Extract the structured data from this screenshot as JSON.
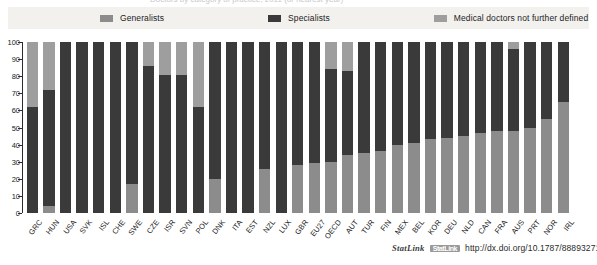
{
  "title_clipped": "Doctors by category of practice, 2011 (or nearest year)",
  "legend": {
    "position": "top",
    "items": [
      {
        "label": "Generalists",
        "color": "#8c8c8c",
        "key": "generalists"
      },
      {
        "label": "Specialists",
        "color": "#3a3a3a",
        "key": "specialists"
      },
      {
        "label": "Medical doctors not further defined",
        "color": "#9e9e9e",
        "key": "not_defined"
      }
    ]
  },
  "y_axis": {
    "ticks": [
      0,
      10,
      20,
      30,
      40,
      50,
      60,
      70,
      80,
      90,
      100
    ],
    "tick_labels": [
      "0",
      "10",
      "20",
      "30",
      "40",
      "50",
      "60",
      "70",
      "80",
      "90",
      "100"
    ],
    "min": 0,
    "max": 100
  },
  "footer": {
    "statlink_label": "StatLink",
    "statlink_glyph": "icon",
    "url": "http://dx.doi.org/10.1787/888932710897"
  },
  "chart_data": {
    "type": "bar",
    "subtype": "stacked-100-percent",
    "title": "Doctors by category of practice, 2011 (or nearest year)",
    "xlabel": "",
    "ylabel": "",
    "ylim": [
      0,
      100
    ],
    "grid": false,
    "legend_position": "top",
    "categories": [
      "GRC",
      "HUN",
      "USA",
      "SVK",
      "ISL",
      "CHE",
      "SWE",
      "CZE",
      "ISR",
      "SVN",
      "POL",
      "DNK",
      "ITA",
      "EST",
      "NZL",
      "LUX",
      "GBR",
      "EU27",
      "OECD",
      "AUT",
      "TUR",
      "FIN",
      "MEX",
      "BEL",
      "KOR",
      "DEU",
      "NLD",
      "CAN",
      "FRA",
      "AUS",
      "PRT",
      "NOR",
      "IRL"
    ],
    "series": [
      {
        "name": "Generalists",
        "color": "#8c8c8c",
        "values": [
          0,
          4,
          0,
          0,
          0,
          0,
          17,
          0,
          0,
          0,
          0,
          20,
          0,
          0,
          26,
          0,
          28,
          29,
          30,
          34,
          35,
          36,
          40,
          41,
          43,
          44,
          45,
          47,
          48,
          48,
          50,
          55,
          65
        ]
      },
      {
        "name": "Specialists",
        "color": "#3a3a3a",
        "values": [
          62,
          68,
          100,
          100,
          100,
          100,
          83,
          86,
          81,
          81,
          62,
          80,
          100,
          100,
          74,
          100,
          72,
          71,
          54,
          49,
          65,
          64,
          60,
          59,
          57,
          56,
          55,
          53,
          52,
          48,
          50,
          45,
          35
        ]
      },
      {
        "name": "Medical doctors not further defined",
        "color": "#9e9e9e",
        "values": [
          38,
          28,
          0,
          0,
          0,
          0,
          0,
          14,
          19,
          19,
          38,
          0,
          0,
          0,
          0,
          0,
          0,
          0,
          16,
          17,
          0,
          0,
          0,
          0,
          0,
          0,
          0,
          0,
          0,
          4,
          0,
          0,
          0
        ]
      }
    ]
  }
}
